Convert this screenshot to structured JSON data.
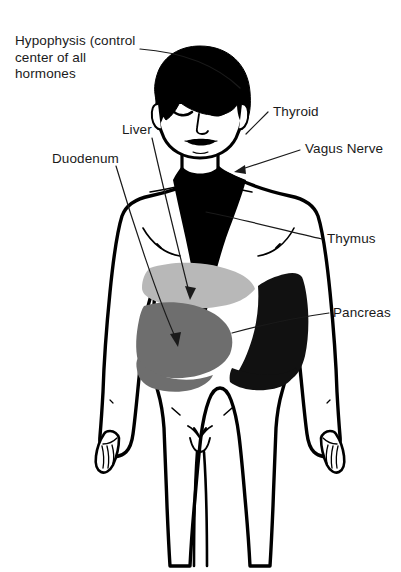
{
  "figure": {
    "background_color": "#ffffff",
    "width": 401,
    "height": 572
  },
  "palette": {
    "outline": "#000000",
    "hair_black": "#000000",
    "thymus_black": "#000000",
    "pancreas_black": "#111111",
    "liver_light_gray": "#b8b8b8",
    "duodenum_mid_gray": "#6e6e6e",
    "stomach_dark_gray": "#4a4a4a",
    "skin_white": "#ffffff",
    "leader_line": "#1a1a1a",
    "text": "#1a1a1a"
  },
  "labels": [
    {
      "id": "hypophysis",
      "name": "Hypophysis",
      "lines": [
        "Hypophysis (control",
        "center of all",
        "hormones"
      ],
      "text": "Hypophysis (control\ncenter of all\nhormones",
      "side": "left",
      "leader": "curved",
      "points_to": "head / pituitary region"
    },
    {
      "id": "duodenum",
      "name": "Duodenum",
      "lines": [
        "Duodenum"
      ],
      "text": "Duodenum",
      "side": "left",
      "leader": "straight-arrow",
      "points_to": "lower abdomen mid-gray organ"
    },
    {
      "id": "liver",
      "name": "Liver",
      "lines": [
        "Liver"
      ],
      "text": "Liver",
      "side": "left",
      "leader": "straight-arrow",
      "points_to": "upper abdomen light-gray organ"
    },
    {
      "id": "thyroid",
      "name": "Thyroid",
      "lines": [
        "Thyroid"
      ],
      "text": "Thyroid",
      "side": "right",
      "leader": "straight",
      "points_to": "neck"
    },
    {
      "id": "vagus-nerve",
      "name": "Vagus Nerve",
      "lines": [
        "Vagus Nerve"
      ],
      "text": "Vagus Nerve",
      "side": "right",
      "leader": "straight-arrow",
      "points_to": "side of neck"
    },
    {
      "id": "thymus",
      "name": "Thymus",
      "lines": [
        "Thymus"
      ],
      "text": "Thymus",
      "side": "right",
      "leader": "straight",
      "points_to": "upper chest black wedge"
    },
    {
      "id": "pancreas",
      "name": "Pancreas",
      "lines": [
        "Pancreas"
      ],
      "text": "Pancreas",
      "side": "right",
      "leader": "straight",
      "points_to": "right abdomen black region"
    }
  ],
  "organs": [
    {
      "id": "liver",
      "label": "Liver",
      "shade": "light gray"
    },
    {
      "id": "duodenum",
      "label": "Duodenum",
      "shade": "mid gray"
    },
    {
      "id": "pancreas",
      "label": "Pancreas",
      "shade": "black"
    },
    {
      "id": "thymus",
      "label": "Thymus",
      "shade": "black"
    }
  ]
}
